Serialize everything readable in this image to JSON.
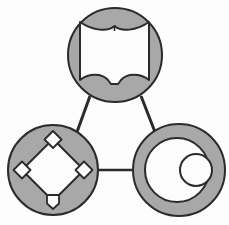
{
  "diagram": {
    "layout": "triangle",
    "background_color": "#fdfdfd",
    "node_fill_color": "#a8a8a8",
    "glyph_fill_color": "#fcfcfc",
    "outline_color": "#2b2b2b",
    "outline_width": 2,
    "connector_width": 3,
    "nodes": [
      {
        "id": "node-top",
        "label": "open-book",
        "icon": "book-icon",
        "cx": 115,
        "cy": 55,
        "r": 48,
        "position": "top"
      },
      {
        "id": "node-bottom-left",
        "label": "baseball-diamond",
        "icon": "diamond-bases-icon",
        "cx": 53,
        "cy": 170,
        "r": 46,
        "position": "bottom-left"
      },
      {
        "id": "node-bottom-right",
        "label": "concentric-circles",
        "icon": "circles-icon",
        "cx": 179,
        "cy": 170,
        "r": 47,
        "position": "bottom-right"
      }
    ],
    "connectors": [
      {
        "id": "connector-top-left",
        "from": "node-top",
        "to": "node-bottom-left",
        "x1": 90,
        "y1": 96,
        "x2": 77,
        "y2": 131
      },
      {
        "id": "connector-top-right",
        "from": "node-top",
        "to": "node-bottom-right",
        "x1": 141,
        "y1": 96,
        "x2": 155,
        "y2": 131
      },
      {
        "id": "connector-bottom",
        "from": "node-bottom-left",
        "to": "node-bottom-right",
        "x1": 99,
        "y1": 170,
        "x2": 132,
        "y2": 170
      }
    ],
    "glyphs": {
      "book": {
        "name": "open-book",
        "description": "open book with concave top edge, spine notch in the middle and scalloped bottom edge",
        "fill": "#fcfcfc"
      },
      "diamond": {
        "name": "baseball-diamond",
        "description": "large rotated square infield with three small rotated square bases and a home plate pentagon",
        "fill": "#fcfcfc",
        "bases": [
          "second-base",
          "third-base",
          "first-base",
          "home-plate"
        ]
      },
      "circles": {
        "name": "concentric-circles",
        "description": "large inner circle with a smaller circle offset to the right",
        "fill": "#fcfcfc",
        "inner_r": 32,
        "small_r": 16
      }
    }
  }
}
